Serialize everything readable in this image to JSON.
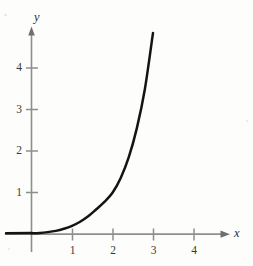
{
  "figure": {
    "background_color": "#fdfdfb",
    "curve_color": "#141414",
    "axis_color": "#8e8e8e",
    "tick_text_color": "#3a3a3a",
    "x_axis_label": "x",
    "y_axis_label": "y"
  },
  "chart_data": {
    "type": "line",
    "title": "",
    "subtitle": "",
    "xlabel": "x",
    "ylabel": "y",
    "xlim": [
      -0.2,
      4.7
    ],
    "ylim": [
      -0.15,
      5.1
    ],
    "xticks": [
      1,
      2,
      3,
      4
    ],
    "yticks": [
      1,
      2,
      3,
      4
    ],
    "xtick_labels": [
      "1",
      "2",
      "3",
      "4"
    ],
    "ytick_labels": [
      "1",
      "2",
      "3",
      "4"
    ],
    "grid": false,
    "legend": null,
    "annotations": [],
    "series": [
      {
        "name": "curve",
        "x": [
          0.0,
          0.2,
          0.4,
          0.6,
          0.8,
          1.0,
          1.2,
          1.4,
          1.6,
          1.8,
          2.0,
          2.2,
          2.4,
          2.6,
          2.8,
          3.0
        ],
        "y": [
          0.02,
          0.03,
          0.05,
          0.08,
          0.13,
          0.2,
          0.3,
          0.43,
          0.6,
          0.78,
          1.0,
          1.35,
          1.85,
          2.55,
          3.5,
          4.85
        ]
      }
    ]
  }
}
